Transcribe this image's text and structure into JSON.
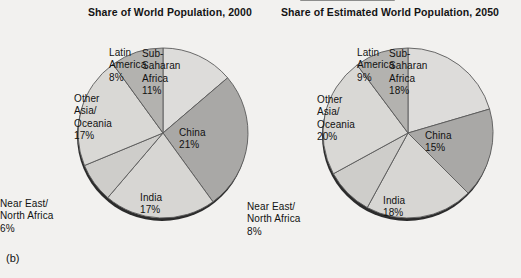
{
  "figure": {
    "panel_label": "(b)",
    "background": "#f2f1ef"
  },
  "charts": [
    {
      "id": "left",
      "title": "Share of World Population, 2000",
      "center": {
        "x": 163,
        "y": 133
      },
      "radius": 85
    },
    {
      "id": "right",
      "title": "Share of Estimated World Population, 2050",
      "center": {
        "x": 408,
        "y": 133
      },
      "radius": 85
    }
  ],
  "labels": {
    "left": {
      "sub_saharan": "Sub-\nSaharan\nAfrica\n11%",
      "china": "China\n21%",
      "india": "India\n17%",
      "near_east": "Near East/\nNorth Africa\n6%",
      "other_asia": "Other\nAsia/\nOceania\n17%",
      "latin_america": "Latin\nAmerica\n8%"
    },
    "right": {
      "sub_saharan": "Sub-\nSaharan\nAfrica\n18%",
      "china": "China\n15%",
      "india": "India\n18%",
      "near_east": "Near East/\nNorth Africa\n8%",
      "other_asia": "Other\nAsia/\nOceania\n20%",
      "latin_america": "Latin\nAmerica\n9%"
    }
  },
  "chart_data": [
    {
      "type": "pie",
      "title": "Share of World Population, 2000",
      "categories": [
        "Sub-Saharan Africa",
        "China",
        "India",
        "Near East/North Africa",
        "Other Asia/Oceania",
        "Latin America"
      ],
      "values": [
        11,
        21,
        17,
        6,
        17,
        8
      ],
      "unit": "%",
      "note": "Slices drawn clockwise starting at 12 o'clock; remaining share (20%) is an unlabeled segment between Sub-Saharan Africa and Latin America regions of the wheel.",
      "colors": [
        "#dddcda",
        "#a9a8a6",
        "#d7d6d3",
        "#cecdca",
        "#d9d8d5",
        "#b3b2af"
      ],
      "legend": "none",
      "labels_inside": true
    },
    {
      "type": "pie",
      "title": "Share of Estimated World Population, 2050",
      "categories": [
        "Sub-Saharan Africa",
        "China",
        "India",
        "Near East/North Africa",
        "Other Asia/Oceania",
        "Latin America"
      ],
      "values": [
        18,
        15,
        18,
        8,
        20,
        9
      ],
      "unit": "%",
      "note": "Slices drawn clockwise starting at 12 o'clock; remaining share (12%) is an unlabeled segment.",
      "colors": [
        "#dddcda",
        "#a9a8a6",
        "#d7d6d3",
        "#cecdca",
        "#d9d8d5",
        "#b3b2af"
      ],
      "legend": "none",
      "labels_inside": true
    }
  ],
  "palette": {
    "slice_light": "#dddcda",
    "slice_medium": "#b3b2af",
    "slice_dark": "#a9a8a6",
    "outline": "#5a5a5a",
    "shadow": "#2b2b2b",
    "text": "#111111"
  }
}
